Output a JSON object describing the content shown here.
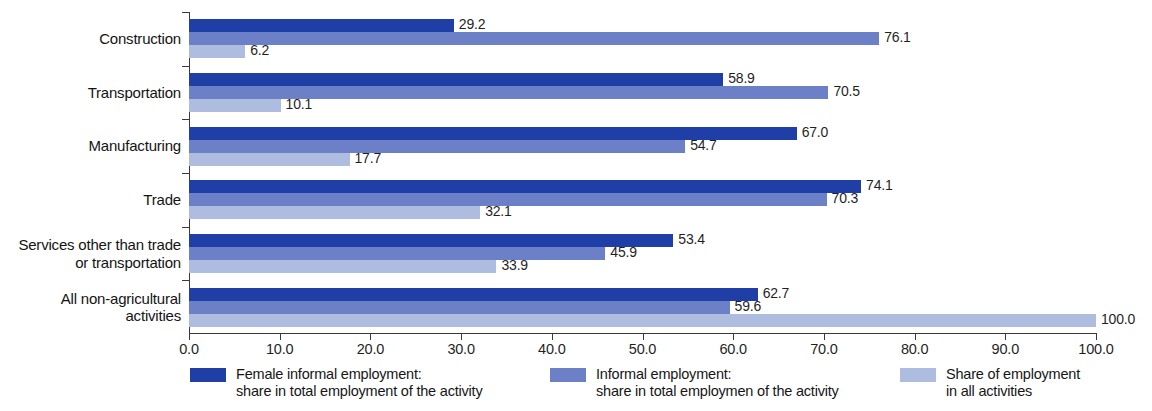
{
  "chart_data": {
    "type": "bar",
    "orientation": "horizontal",
    "title": "",
    "subtitle": "",
    "xlabel": "",
    "ylabel": "",
    "xlim": [
      0.0,
      100.0
    ],
    "xticks": [
      "0.0",
      "10.0",
      "20.0",
      "30.0",
      "40.0",
      "50.0",
      "60.0",
      "70.0",
      "80.0",
      "90.0",
      "100.0"
    ],
    "xtick_values": [
      0,
      10,
      20,
      30,
      40,
      50,
      60,
      70,
      80,
      90,
      100
    ],
    "grid": false,
    "legend_position": "bottom",
    "categories": [
      "Construction",
      "Transportation",
      "Manufacturing",
      "Trade",
      "Services other than trade\nor transportation",
      "All non-agricultural\nactivities"
    ],
    "series": [
      {
        "name": "Female informal employment:\nshare in total employment of the activity",
        "color": "#1f3fa6",
        "values": [
          29.2,
          58.9,
          67.0,
          74.1,
          53.4,
          62.7
        ],
        "labels": [
          "29.2",
          "58.9",
          "67.0",
          "74.1",
          "53.4",
          "62.7"
        ]
      },
      {
        "name": "Informal employment:\nshare in total employmen of the activity",
        "color": "#6c80c8",
        "values": [
          76.1,
          70.5,
          54.7,
          70.3,
          45.9,
          59.6
        ],
        "labels": [
          "76.1",
          "70.5",
          "54.7",
          "70.3",
          "45.9",
          "59.6"
        ]
      },
      {
        "name": "Share of employment\nin all activities",
        "color": "#aebcdf",
        "values": [
          6.2,
          10.1,
          17.7,
          32.1,
          33.9,
          100.0
        ],
        "labels": [
          "6.2",
          "10.1",
          "17.7",
          "32.1",
          "33.9",
          "100.0"
        ]
      }
    ]
  },
  "legend": [
    {
      "swatch": "s0",
      "line1": "Female informal employment:",
      "line2": "share in total employment of the activity"
    },
    {
      "swatch": "s1",
      "line1": "Informal employment:",
      "line2": "share in total employmen of the activity"
    },
    {
      "swatch": "s2",
      "line1": "Share of employment",
      "line2": "in all activities"
    }
  ],
  "colors": {
    "series_dark": "#1f3fa6",
    "series_medium": "#6c80c8",
    "series_light": "#aebcdf",
    "axis": "#3a3a3a",
    "text": "#1a1a1a",
    "background": "#ffffff"
  }
}
